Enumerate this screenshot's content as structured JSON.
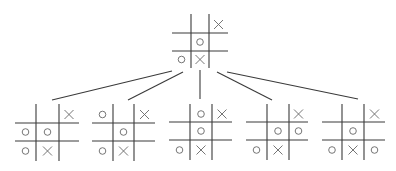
{
  "diagram": {
    "colors": {
      "grid": "#3a3a3a",
      "marks": "#666666",
      "background": "#ffffff"
    },
    "root": {
      "id": "root",
      "board": [
        [
          "",
          "",
          "X"
        ],
        [
          "",
          "O",
          ""
        ],
        [
          "O",
          "X",
          ""
        ]
      ],
      "grid": {
        "v1": 191,
        "v2": 209,
        "h1": 33,
        "h2": 51,
        "left": 172,
        "right": 228,
        "top": 14,
        "bottom": 68
      }
    },
    "children": [
      {
        "id": "child-1",
        "move": "O plays middle-left",
        "board": [
          [
            "",
            "",
            "X"
          ],
          [
            "O",
            "O",
            ""
          ],
          [
            "O",
            "X",
            ""
          ]
        ],
        "grid": {
          "v1": 36,
          "v2": 59,
          "h1": 123,
          "h2": 141,
          "left": 15,
          "right": 79,
          "top": 104,
          "bottom": 161
        }
      },
      {
        "id": "child-2",
        "move": "O plays top-left",
        "board": [
          [
            "O",
            "",
            "X"
          ],
          [
            "",
            "O",
            ""
          ],
          [
            "O",
            "X",
            ""
          ]
        ],
        "grid": {
          "v1": 113,
          "v2": 134,
          "h1": 123,
          "h2": 141,
          "left": 92,
          "right": 155,
          "top": 104,
          "bottom": 161
        }
      },
      {
        "id": "child-3",
        "move": "O plays top-middle",
        "board": [
          [
            "",
            "O",
            "X"
          ],
          [
            "",
            "O",
            ""
          ],
          [
            "O",
            "X",
            ""
          ]
        ],
        "grid": {
          "v1": 190,
          "v2": 212,
          "h1": 122,
          "h2": 140,
          "left": 169,
          "right": 232,
          "top": 104,
          "bottom": 160
        }
      },
      {
        "id": "child-4",
        "move": "O plays middle-right",
        "board": [
          [
            "",
            "",
            "X"
          ],
          [
            "",
            "O",
            "O"
          ],
          [
            "O",
            "X",
            ""
          ]
        ],
        "grid": {
          "v1": 267,
          "v2": 289,
          "h1": 122,
          "h2": 140,
          "left": 246,
          "right": 308,
          "top": 104,
          "bottom": 160
        }
      },
      {
        "id": "child-5",
        "move": "O plays bottom-right",
        "board": [
          [
            "",
            "",
            "X"
          ],
          [
            "",
            "O",
            ""
          ],
          [
            "O",
            "X",
            "O"
          ]
        ],
        "grid": {
          "v1": 342,
          "v2": 364,
          "h1": 122,
          "h2": 140,
          "left": 322,
          "right": 385,
          "top": 104,
          "bottom": 160
        }
      }
    ],
    "edges": [
      {
        "from": "root",
        "to": "child-1",
        "x1": 172,
        "y1": 71,
        "x2": 52,
        "y2": 100
      },
      {
        "from": "root",
        "to": "child-2",
        "x1": 183,
        "y1": 72,
        "x2": 128,
        "y2": 100
      },
      {
        "from": "root",
        "to": "child-3",
        "x1": 200,
        "y1": 70,
        "x2": 200,
        "y2": 99
      },
      {
        "from": "root",
        "to": "child-4",
        "x1": 217,
        "y1": 72,
        "x2": 272,
        "y2": 100
      },
      {
        "from": "root",
        "to": "child-5",
        "x1": 227,
        "y1": 72,
        "x2": 358,
        "y2": 99
      }
    ]
  }
}
